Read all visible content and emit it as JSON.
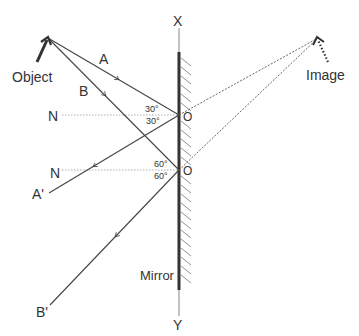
{
  "labels": {
    "object": "Object",
    "image": "Image",
    "ray_a": "A",
    "ray_b": "B",
    "normal_1": "N",
    "normal_2": "N",
    "reflected_a": "A'",
    "reflected_b": "B'",
    "point_o1": "O",
    "point_o2": "O",
    "mirror_top": "X",
    "mirror_bottom": "Y",
    "mirror": "Mirror",
    "angle_i1": "30°",
    "angle_r1": "30°",
    "angle_i2": "60°",
    "angle_r2": "60°"
  },
  "colors": {
    "line": "#444444",
    "mirror": "#333333",
    "normal": "#999999",
    "text": "#333333"
  }
}
